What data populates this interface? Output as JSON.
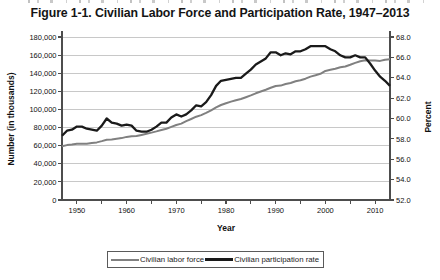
{
  "chart_data": {
    "type": "line",
    "title": "Figure 1-1. Civilian Labor Force and Participation Rate, 1947–2013",
    "xlabel": "Year",
    "ylabel_left": "Number (in thousands)",
    "ylabel_right": "Percent",
    "grid": "horizontal",
    "legend_position": "bottom-center",
    "x_range": [
      1947,
      2013
    ],
    "x_minor_tick_interval": 5,
    "x_ticks": [
      {
        "value": 1950,
        "label": "1950"
      },
      {
        "value": 1960,
        "label": "1960"
      },
      {
        "value": 1970,
        "label": "1970"
      },
      {
        "value": 1980,
        "label": "1980"
      },
      {
        "value": 1990,
        "label": "1990"
      },
      {
        "value": 2000,
        "label": "2000"
      },
      {
        "value": 2010,
        "label": "2010"
      }
    ],
    "ylim_left": [
      0,
      180000
    ],
    "y_left_ticks": [
      {
        "value": 0,
        "label": "0"
      },
      {
        "value": 20000,
        "label": "20,000"
      },
      {
        "value": 40000,
        "label": "40,000"
      },
      {
        "value": 60000,
        "label": "60,000"
      },
      {
        "value": 80000,
        "label": "80,000"
      },
      {
        "value": 100000,
        "label": "100,000"
      },
      {
        "value": 120000,
        "label": "120,000"
      },
      {
        "value": 140000,
        "label": "140,000"
      },
      {
        "value": 160000,
        "label": "160,000"
      },
      {
        "value": 180000,
        "label": "180,000"
      }
    ],
    "ylim_right": [
      52,
      68
    ],
    "y_right_ticks": [
      {
        "value": 52,
        "label": "52.0"
      },
      {
        "value": 54,
        "label": "54.0"
      },
      {
        "value": 56,
        "label": "56.0"
      },
      {
        "value": 58,
        "label": "58.0"
      },
      {
        "value": 60,
        "label": "60.0"
      },
      {
        "value": 62,
        "label": "62.0"
      },
      {
        "value": 64,
        "label": "64.0"
      },
      {
        "value": 66,
        "label": "66.0"
      },
      {
        "value": 68,
        "label": "68.0"
      }
    ],
    "colors": {
      "gridline": "#c8c8c8",
      "axis": "#4d4d4d",
      "text": "#111111"
    },
    "years": [
      1947,
      1948,
      1949,
      1950,
      1951,
      1952,
      1953,
      1954,
      1955,
      1956,
      1957,
      1958,
      1959,
      1960,
      1961,
      1962,
      1963,
      1964,
      1965,
      1966,
      1967,
      1968,
      1969,
      1970,
      1971,
      1972,
      1973,
      1974,
      1975,
      1976,
      1977,
      1978,
      1979,
      1980,
      1981,
      1982,
      1983,
      1984,
      1985,
      1986,
      1987,
      1988,
      1989,
      1990,
      1991,
      1992,
      1993,
      1994,
      1995,
      1996,
      1997,
      1998,
      1999,
      2000,
      2001,
      2002,
      2003,
      2004,
      2005,
      2006,
      2007,
      2008,
      2009,
      2010,
      2011,
      2012,
      2013
    ],
    "series": [
      {
        "name": "Civilian labor force",
        "axis": "left",
        "color": "#808080",
        "stroke_width": 2,
        "values": [
          59350,
          60621,
          61286,
          62208,
          62017,
          62138,
          63015,
          63643,
          65023,
          66552,
          66929,
          67639,
          68369,
          69628,
          70459,
          70614,
          71833,
          73091,
          74455,
          75770,
          77347,
          78737,
          80734,
          82771,
          84382,
          87034,
          89429,
          91949,
          93775,
          96158,
          99009,
          102251,
          104962,
          106940,
          108670,
          110204,
          111550,
          113544,
          115461,
          117834,
          119865,
          121669,
          123869,
          125840,
          126346,
          128105,
          129200,
          131056,
          132304,
          133943,
          136297,
          137673,
          139368,
          142583,
          143734,
          144863,
          146510,
          147401,
          149320,
          151428,
          153124,
          154287,
          154142,
          153889,
          153617,
          154975,
          155389
        ]
      },
      {
        "name": "Civilian participation rate",
        "axis": "right",
        "color": "#1a1a1a",
        "stroke_width": 2.3,
        "values": [
          58.3,
          58.8,
          58.9,
          59.2,
          59.2,
          59.0,
          58.9,
          58.8,
          59.3,
          60.0,
          59.6,
          59.5,
          59.3,
          59.4,
          59.3,
          58.8,
          58.7,
          58.7,
          58.9,
          59.2,
          59.6,
          59.6,
          60.1,
          60.4,
          60.2,
          60.4,
          60.8,
          61.3,
          61.2,
          61.6,
          62.3,
          63.2,
          63.7,
          63.8,
          63.9,
          64.0,
          64.0,
          64.4,
          64.8,
          65.3,
          65.6,
          65.9,
          66.5,
          66.5,
          66.2,
          66.4,
          66.3,
          66.6,
          66.6,
          66.8,
          67.1,
          67.1,
          67.1,
          67.1,
          66.8,
          66.6,
          66.2,
          66.0,
          66.0,
          66.2,
          66.0,
          66.0,
          65.4,
          64.7,
          64.1,
          63.7,
          63.2
        ]
      }
    ]
  }
}
